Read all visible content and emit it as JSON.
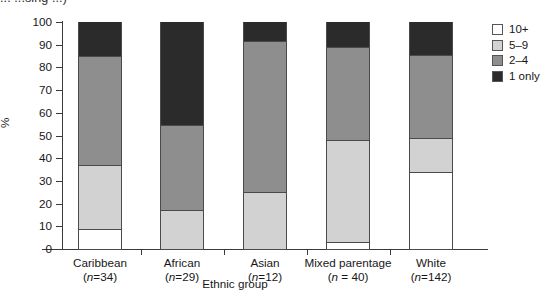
{
  "clipped_title": "...  ...sing  ...)",
  "chart_data": {
    "type": "bar",
    "variant": "stacked-100-percent",
    "title": "",
    "xlabel": "Ethnic group",
    "ylabel": "%",
    "ylim": [
      0,
      100
    ],
    "yticks": [
      0,
      10,
      20,
      30,
      40,
      50,
      60,
      70,
      80,
      90,
      100
    ],
    "grid": false,
    "legend_position": "right",
    "categories": [
      "Caribbean",
      "African",
      "Asian",
      "Mixed parentage",
      "White"
    ],
    "category_sublabels": [
      "(n=34)",
      "(n=29)",
      "(n=12)",
      "(n = 40)",
      "(n=142)"
    ],
    "series": [
      {
        "name": "1 only",
        "color": "#2b2b2b",
        "values": [
          15,
          45.5,
          8.5,
          11,
          14.5
        ]
      },
      {
        "name": "2–4",
        "color": "#8e8e8e",
        "values": [
          48,
          37.5,
          66.5,
          41,
          36.5
        ]
      },
      {
        "name": "5–9",
        "color": "#d2d2d2",
        "values": [
          28,
          17,
          25,
          45,
          15
        ]
      },
      {
        "name": "10+",
        "color": "#ffffff",
        "values": [
          9,
          0,
          0,
          3,
          34
        ]
      }
    ],
    "legend": [
      {
        "label": "10+",
        "color": "#ffffff"
      },
      {
        "label": "5–9",
        "color": "#d2d2d2"
      },
      {
        "label": "2–4",
        "color": "#8e8e8e"
      },
      {
        "label": "1 only",
        "color": "#2b2b2b"
      }
    ]
  }
}
